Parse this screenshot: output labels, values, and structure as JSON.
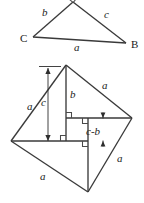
{
  "figure": {
    "background_color": "#ffffff",
    "line_color": "#3a3a3a",
    "text_color": "#1a1a1a",
    "top_triangle": {
      "name": "right-triangle-ABC",
      "vertices": [
        {
          "name": "A",
          "label": "",
          "x": 73,
          "y": 2
        },
        {
          "name": "C",
          "label": "C",
          "x": 33,
          "y": 37
        },
        {
          "name": "B",
          "label": "B",
          "x": 126,
          "y": 43
        }
      ],
      "vertex_labels": [
        {
          "key": "C",
          "text": "C",
          "x": 20,
          "y": 42
        },
        {
          "key": "B",
          "text": "B",
          "x": 131,
          "y": 48
        }
      ],
      "side_labels": [
        {
          "key": "b",
          "text": "b",
          "x": 42,
          "y": 15
        },
        {
          "key": "c",
          "text": "c",
          "x": 104,
          "y": 17
        },
        {
          "key": "a",
          "text": "a",
          "x": 74,
          "y": 50
        }
      ],
      "right_angle_at": "A"
    },
    "bottom_square": {
      "name": "tilted-square-dissection",
      "vertices": [
        {
          "name": "top",
          "x": 66,
          "y": 65
        },
        {
          "name": "right",
          "x": 132,
          "y": 118
        },
        {
          "name": "bottom",
          "x": 88,
          "y": 192
        },
        {
          "name": "left",
          "x": 11,
          "y": 141
        }
      ],
      "side_labels": [
        {
          "key": "a-upper-left",
          "text": "a",
          "x": 29,
          "y": 108
        },
        {
          "key": "a-upper-right",
          "text": "a",
          "x": 104,
          "y": 87
        },
        {
          "key": "a-lower-right",
          "text": "a",
          "x": 119,
          "y": 159
        },
        {
          "key": "a-lower-left",
          "text": "a",
          "x": 42,
          "y": 177
        }
      ],
      "inner_labels": [
        {
          "key": "c",
          "text": "c",
          "x": 44,
          "y": 104
        },
        {
          "key": "b",
          "text": "b",
          "x": 71,
          "y": 96
        },
        {
          "key": "c-b",
          "text": "c-b",
          "x": 92,
          "y": 132
        }
      ],
      "dimension_arrows": [
        {
          "key": "c-height",
          "orientation": "vertical",
          "x": 48,
          "y_top": 68,
          "y_bottom": 141
        },
        {
          "key": "c-minus-b",
          "orientation": "vertical",
          "x": 103,
          "y_top": 114,
          "y_bottom": 148
        }
      ],
      "right_angle_markers": 4
    }
  }
}
